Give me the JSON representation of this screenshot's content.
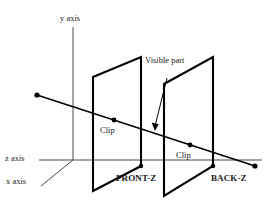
{
  "figure": {
    "background_color": "#ffffff",
    "line_color": "#000000",
    "axis_color": "#4a4a4a"
  },
  "axes": {
    "y_label": "y axis",
    "z_label": "z axis",
    "x_label": "x axis"
  },
  "planes": {
    "front_label": "FRONT-Z",
    "back_label": "BACK-Z"
  },
  "annotations": {
    "visible_part": "Visible part",
    "clip_front": "Clip",
    "clip_back": "Clip"
  }
}
